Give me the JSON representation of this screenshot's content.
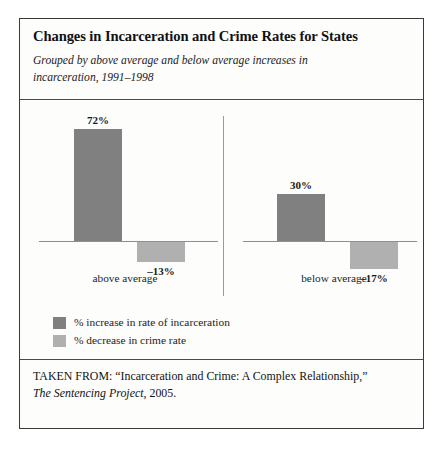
{
  "figure": {
    "title": "Changes in Incarceration and Crime Rates for States",
    "subtitle": "Grouped by above average and below average increases in incarceration, 1991–1998"
  },
  "chart_data": {
    "type": "bar",
    "title": "Changes in Incarceration and Crime Rates for States",
    "subtitle": "Grouped by above average and below average increases in incarceration, 1991–1998",
    "xlabel": "",
    "ylabel": "",
    "ylim": [
      -20,
      80
    ],
    "grid": false,
    "legend_position": "below-plot",
    "zero_baseline": true,
    "panel_divider": true,
    "categories": [
      "above average",
      "below average"
    ],
    "series": [
      {
        "name": "% increase in rate of incarceration",
        "color": "#808080",
        "values": [
          72,
          30
        ],
        "labels": [
          "72%",
          "30%"
        ]
      },
      {
        "name": "% decrease in crime rate",
        "color": "#b0b0b0",
        "values": [
          -13,
          -17
        ],
        "labels": [
          "–13%",
          "–17%"
        ]
      }
    ]
  },
  "panels": [
    {
      "category": "above average",
      "bars": [
        {
          "label": "72%",
          "value": 72,
          "series": "% increase in rate of incarceration"
        },
        {
          "label": "–13%",
          "value": -13,
          "series": "% decrease in crime rate"
        }
      ]
    },
    {
      "category": "below average",
      "bars": [
        {
          "label": "30%",
          "value": 30,
          "series": "% increase in rate of incarceration"
        },
        {
          "label": "–17%",
          "value": -17,
          "series": "% decrease in crime rate"
        }
      ]
    }
  ],
  "legend": [
    {
      "label": "% increase in rate of incarceration",
      "color": "#808080"
    },
    {
      "label": "% decrease in crime rate",
      "color": "#b0b0b0"
    }
  ],
  "source": {
    "line1_prefix": "TAKEN FROM: “Incarceration and Crime: A Complex Relationship,”",
    "publication": "The Sentencing Project",
    "line2_suffix": ", 2005."
  },
  "colors": {
    "bar_dark": "#808080",
    "bar_light": "#b0b0b0",
    "frame": "#3a3a3a",
    "axis": "#8f8f8f",
    "background": "#fdfdfc"
  }
}
